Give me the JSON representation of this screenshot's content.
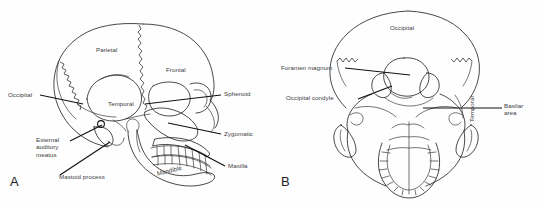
{
  "figure": {
    "background_color": "#fefefe",
    "line_color": "#1a1a1a",
    "text_color": "#3c3c3c"
  },
  "panels": [
    {
      "letter": "A",
      "name": "lateral-skull-view",
      "description": "Lateral (side) view of an infant skull",
      "labels": [
        {
          "id": "parietal",
          "text": "Parietal",
          "type": "inline",
          "x": 96,
          "y": 46
        },
        {
          "id": "frontal",
          "text": "Frontal",
          "type": "inline",
          "x": 166,
          "y": 66
        },
        {
          "id": "temporal",
          "text": "Temporal",
          "type": "inline",
          "x": 108,
          "y": 100
        },
        {
          "id": "occipital",
          "text": "Occipital",
          "type": "leader",
          "x": 8,
          "y": 93
        },
        {
          "id": "sphenoid",
          "text": "Sphenoid",
          "type": "leader",
          "x": 224,
          "y": 92
        },
        {
          "id": "zygomatic",
          "text": "Zygomatic",
          "type": "leader",
          "x": 224,
          "y": 131
        },
        {
          "id": "maxilla",
          "text": "Maxilla",
          "type": "leader",
          "x": 228,
          "y": 165
        },
        {
          "id": "mandible",
          "text": "Mandible",
          "type": "inline",
          "x": 158,
          "y": 168
        },
        {
          "id": "external-auditory-meatus",
          "text": "External\nauditory\nmeatus",
          "type": "leader",
          "x": 36,
          "y": 136
        },
        {
          "id": "mastoid-process",
          "text": "Mastoid process",
          "type": "leader",
          "x": 59,
          "y": 177
        }
      ]
    },
    {
      "letter": "B",
      "name": "posterior-inferior-skull-view",
      "description": "Posterior / basal view of an infant skull showing foramen magnum",
      "labels": [
        {
          "id": "occipital-b",
          "text": "Occipital",
          "type": "inline",
          "x": 390,
          "y": 26
        },
        {
          "id": "foramen-magnum",
          "text": "Foramen magnum",
          "type": "leader",
          "x": 284,
          "y": 66
        },
        {
          "id": "occipital-condyle",
          "text": "Occipital condyle",
          "type": "leader",
          "x": 288,
          "y": 96
        },
        {
          "id": "temporal-b",
          "text": "Temporal",
          "type": "inline",
          "x": 474,
          "y": 115
        },
        {
          "id": "basilar-area",
          "text": "Basilar\narea",
          "type": "leader",
          "x": 505,
          "y": 104
        }
      ]
    }
  ]
}
